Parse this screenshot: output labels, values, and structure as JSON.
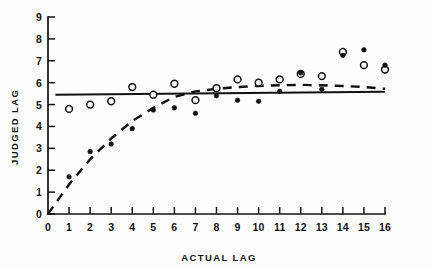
{
  "chart_data": {
    "type": "scatter",
    "title": "",
    "subtitle": "",
    "xlabel": "ACTUAL LAG",
    "ylabel": "JUDGED LAG",
    "xlim": [
      0,
      16
    ],
    "ylim": [
      0,
      9
    ],
    "xticks": [
      0,
      1,
      2,
      3,
      4,
      5,
      6,
      7,
      8,
      9,
      10,
      11,
      12,
      13,
      14,
      15,
      16
    ],
    "xticklabels": [
      "0",
      "1",
      "2",
      "3",
      "4",
      "5",
      "6",
      "7",
      "8",
      "9",
      "10",
      "11",
      "12",
      "13",
      "14",
      "15",
      "16"
    ],
    "yticks": [
      0,
      1,
      2,
      3,
      4,
      5,
      6,
      7,
      8,
      9
    ],
    "yticklabels": [
      "0",
      "1",
      "2",
      "3",
      "4",
      "5",
      "6",
      "7",
      "8",
      "9"
    ],
    "grid": false,
    "legend": null,
    "series": [
      {
        "name": "open-circle-points",
        "marker": "open-circle",
        "x": [
          1,
          2,
          3,
          4,
          5,
          6,
          7,
          8,
          9,
          10,
          11,
          12,
          13,
          14,
          15,
          16
        ],
        "values": [
          4.8,
          5.0,
          5.15,
          5.8,
          5.45,
          5.95,
          5.2,
          5.75,
          6.15,
          6.0,
          6.15,
          6.4,
          6.3,
          7.4,
          6.8,
          6.6
        ]
      },
      {
        "name": "filled-dot-points",
        "marker": "filled-dot",
        "x": [
          1,
          2,
          3,
          4,
          5,
          6,
          7,
          8,
          9,
          10,
          11,
          12,
          13,
          14,
          15,
          16
        ],
        "values": [
          1.7,
          2.85,
          3.2,
          3.9,
          4.75,
          4.85,
          4.6,
          5.4,
          5.2,
          5.15,
          5.6,
          6.45,
          5.7,
          7.25,
          7.5,
          6.8
        ]
      }
    ],
    "fit_lines": [
      {
        "name": "horizontal-fit-line",
        "style": "solid",
        "x": [
          0.35,
          16
        ],
        "values": [
          5.45,
          5.58
        ]
      },
      {
        "name": "negatively-accelerated-fit-curve",
        "style": "dashed",
        "x": [
          0,
          1,
          2,
          3,
          4,
          5,
          6,
          7,
          8,
          9,
          10,
          11,
          12,
          13,
          14,
          15,
          16
        ],
        "values": [
          0.0,
          1.35,
          2.5,
          3.45,
          4.25,
          4.85,
          5.35,
          5.6,
          5.72,
          5.8,
          5.85,
          5.88,
          5.9,
          5.88,
          5.85,
          5.8,
          5.72
        ]
      }
    ],
    "annotations": []
  },
  "figure": {
    "background_color": "#fdfdfd",
    "ink_color": "#111111"
  }
}
